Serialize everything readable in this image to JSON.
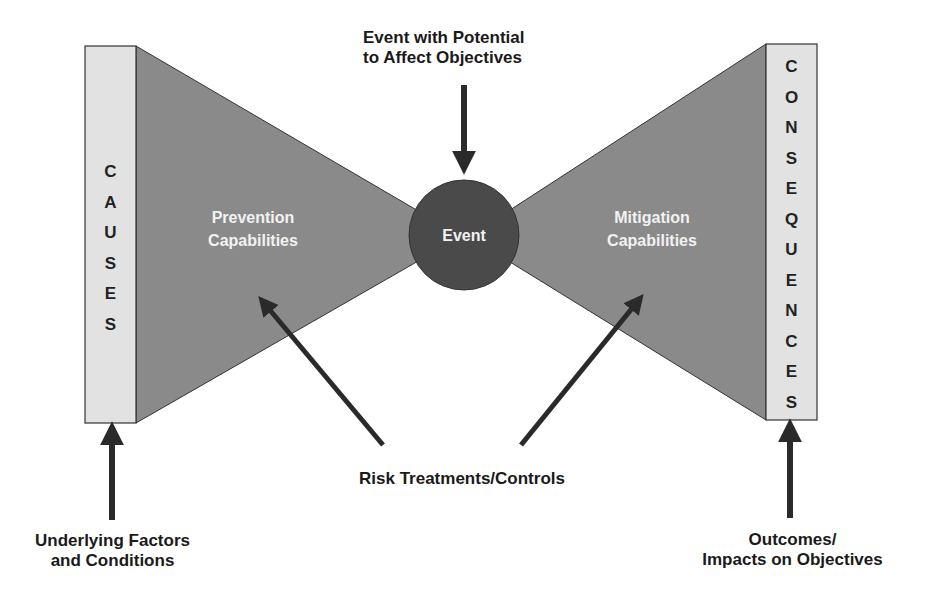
{
  "diagram": {
    "type": "bow-tie",
    "causes": {
      "letters": [
        "C",
        "A",
        "U",
        "S",
        "E",
        "S"
      ],
      "label": "CAUSES"
    },
    "consequences": {
      "letters": [
        "C",
        "O",
        "N",
        "S",
        "E",
        "Q",
        "U",
        "E",
        "N",
        "C",
        "E",
        "S"
      ],
      "label": "CONSEQUENCES"
    },
    "prevention": {
      "line1": "Prevention",
      "line2": "Capabilities"
    },
    "mitigation": {
      "line1": "Mitigation",
      "line2": "Capabilities"
    },
    "event": {
      "label": "Event"
    },
    "top_label": {
      "line1": "Event with Potential",
      "line2": "to Affect Objectives"
    },
    "treatments_label": "Risk Treatments/Controls",
    "bottom_left_label": {
      "line1": "Underlying Factors",
      "line2": "and Conditions"
    },
    "bottom_right_label": {
      "line1": "Outcomes/",
      "line2": "Impacts on Objectives"
    },
    "colors": {
      "box_fill": "#e2e2e2",
      "triangle_fill": "#8a8a8a",
      "circle_fill": "#4a4a4a",
      "arrow": "#2a2a2a",
      "outline": "#333333"
    }
  }
}
